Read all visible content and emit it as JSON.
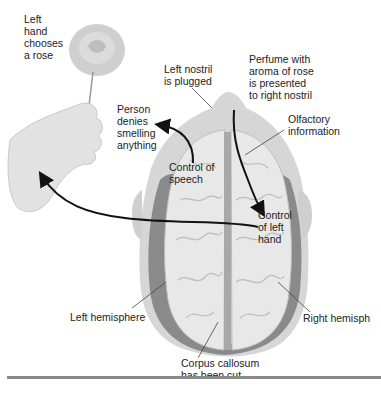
{
  "figure": {
    "caption_fragment": "",
    "labels": {
      "left_hand": "Left\nhand\nchooses\na rose",
      "left_nostril": "Left nostril\nis plugged",
      "perfume": "Perfume with\naroma of rose\nis presented\nto right nostril",
      "person_denies": "Person\ndenies\nsmelling\nanything",
      "olfactory": "Olfactory\ninformation",
      "control_speech": "Control of\nspeech",
      "control_left_hand": "Control\nof left\nhand",
      "left_hemisphere": "Left hemisphere",
      "right_hemisphere": "Right hemisph",
      "corpus_callosum": "Corpus callosum\nhas been cut"
    },
    "icons": [
      "rose-illustration",
      "hand-illustration",
      "brain-top-view-illustration",
      "arrow-speech-to-denial",
      "arrow-olfactory-to-hand-control",
      "arrow-hand-control-to-hand"
    ],
    "colors": {
      "brain_fill": "#e6e6e6",
      "brain_shadow": "#7a7a7a",
      "head_fill": "#d4d4d4",
      "arrow": "#111111",
      "divider": "#8a8a8a"
    }
  }
}
